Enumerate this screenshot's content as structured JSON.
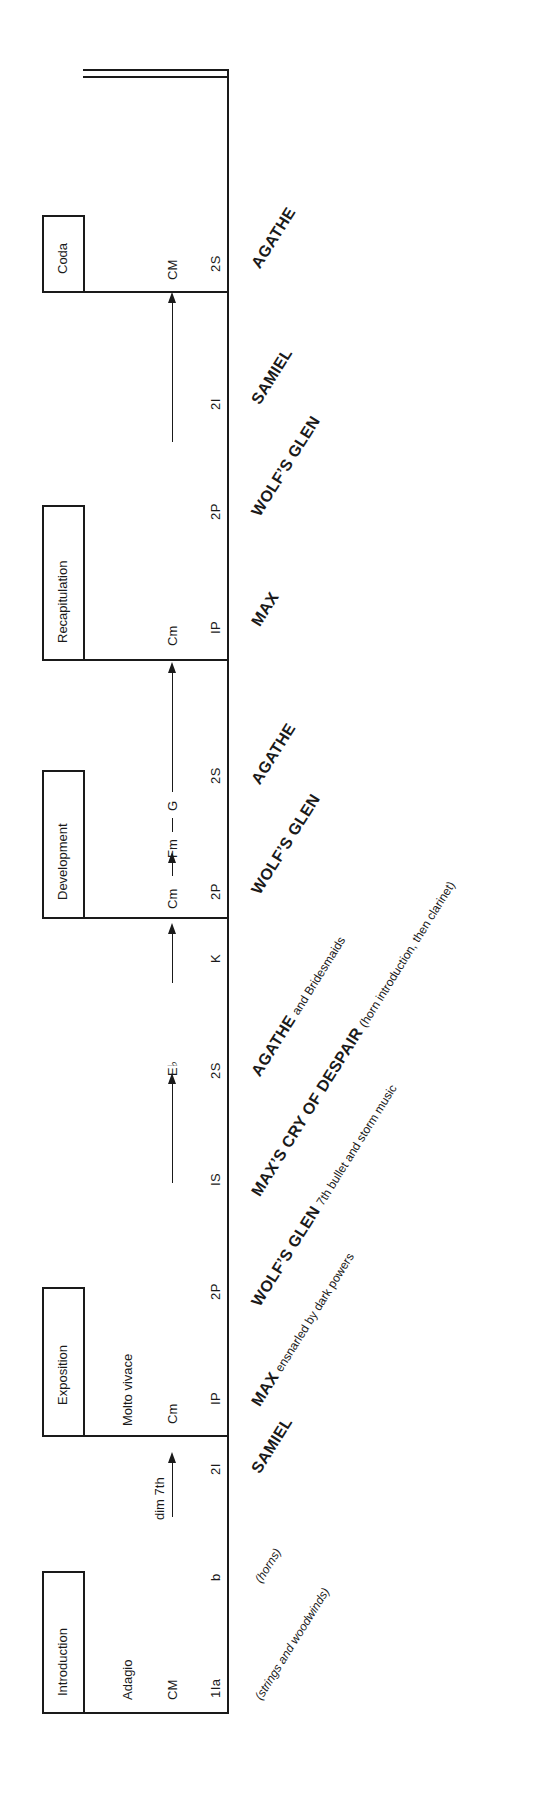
{
  "diagram": {
    "orientation": "rotated-90-ccw",
    "sections": [
      {
        "label": "Introduction",
        "tempo": "Adagio"
      },
      {
        "label": "Exposition",
        "tempo": "Molto vivace"
      },
      {
        "label": "Development",
        "tempo": ""
      },
      {
        "label": "Recapitulation",
        "tempo": ""
      },
      {
        "label": "Coda",
        "tempo": ""
      }
    ],
    "keys": {
      "intro_key": "CM",
      "intro_transition": "dim 7th",
      "expo_key": "Cm",
      "expo_target": "E♭",
      "dev_progression_a": "Cm",
      "dev_progression_b": "Fm",
      "dev_progression_c": "G",
      "recap_key": "Cm",
      "coda_key": "CM"
    },
    "codes": [
      "1Ia",
      "b",
      "2I",
      "IP",
      "2P",
      "IS",
      "2S",
      "K",
      "2P",
      "2S",
      "IP",
      "2P",
      "2I",
      "2S"
    ],
    "labels": {
      "intro_strings": "(strings and woodwinds)",
      "intro_horns": "(horns)",
      "samiel_1": "SAMIEL",
      "max_1": "MAX",
      "max_1_note": "ensnarled by dark powers",
      "wolfs_glen_1": "WOLF’S GLEN",
      "wolfs_glen_1_note": "7th bullet and storm music",
      "max_cry": "MAX’S CRY OF DESPAIR",
      "max_cry_note": "(horn introduction, then clarinet)",
      "agathe_1": "AGATHE",
      "agathe_1_note": "and Bridesmaids",
      "wolfs_glen_2": "WOLF’S GLEN",
      "agathe_2": "AGATHE",
      "max_2": "MAX",
      "wolfs_glen_3": "WOLF’S GLEN",
      "samiel_2": "SAMIEL",
      "agathe_3": "AGATHE"
    }
  }
}
